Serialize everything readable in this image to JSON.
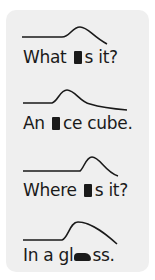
{
  "figure": {
    "type": "intonation-contours",
    "background_color": "#efefef",
    "line_color": "#1a1a1a",
    "items": [
      {
        "before": "What ",
        "stressed": "i",
        "after": "s it?",
        "text": "What is it?",
        "contour": "M22,37 L62,37 C70,37 72,27 80,27 C88,27 92,36 107,44"
      },
      {
        "before": "An ",
        "stressed": "i",
        "after": "ce cube.",
        "text": "An ice cube.",
        "contour": "M23,103 L52,103 C58,101 60,90 67,90 C75,90 80,102 90,104 C100,107 115,109 127,110"
      },
      {
        "before": "Where ",
        "stressed": "i",
        "after": "s it?",
        "text": "Where is it?",
        "contour": "M23,171 L80,171 C84,168 86,157 92,157 C100,157 105,172 118,176"
      },
      {
        "before": "In a gl",
        "stressed": "a",
        "after": "ss.",
        "text": "In a glass.",
        "contour": "M23,240 L62,240 C68,238 70,222 78,222 C92,222 108,236 117,244"
      }
    ]
  }
}
